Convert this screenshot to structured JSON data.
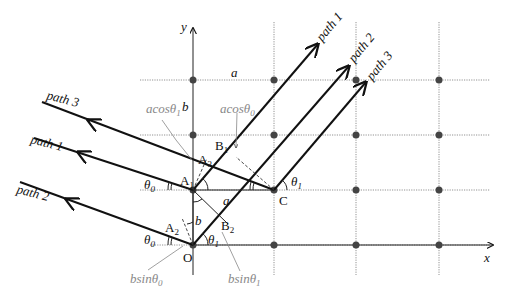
{
  "diagram": {
    "axes": {
      "x_label": "x",
      "y_label": "y"
    },
    "grid": {
      "columns_x": [
        193,
        274,
        356,
        439
      ],
      "rows_y": [
        80,
        135,
        190,
        245
      ],
      "spacing_labels": {
        "horizontal": "a",
        "vertical": "b"
      }
    },
    "points": {
      "O": "O",
      "A1": "A",
      "A1_sub": "1",
      "A2": "A",
      "A2_sub": "2",
      "A3": "A",
      "A3_sub": "3",
      "B1": "B",
      "B1_sub": "1",
      "B2": "B",
      "B2_sub": "2",
      "C": "C"
    },
    "incoming_paths": [
      "path 3",
      "path 1",
      "path 2"
    ],
    "outgoing_paths": [
      "path 1",
      "path 2",
      "path 3"
    ],
    "angles": {
      "theta0": "θ",
      "theta0_sub": "0",
      "theta1": "θ",
      "theta1_sub": "1"
    },
    "annotations": {
      "acos_theta1": {
        "main": "acosθ",
        "sub": "1"
      },
      "acos_theta0": {
        "main": "acosθ",
        "sub": "0"
      },
      "bsin_theta0": {
        "main": "bsinθ",
        "sub": "0"
      },
      "bsin_theta1": {
        "main": "bsinθ",
        "sub": "1"
      },
      "segment_a": "a",
      "segment_b": "b"
    }
  }
}
